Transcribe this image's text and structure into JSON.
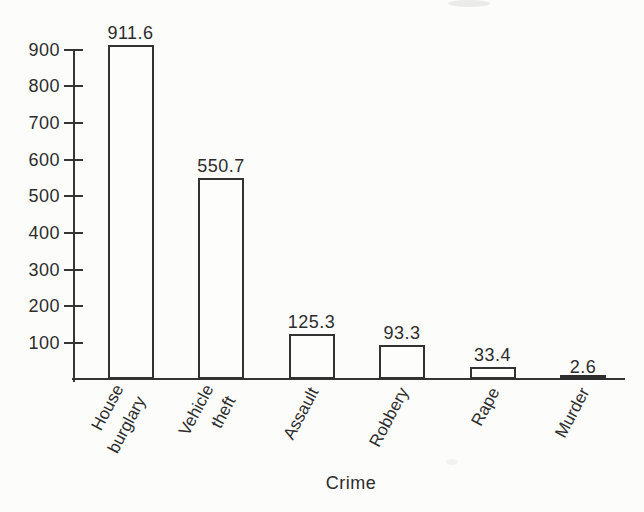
{
  "figure": {
    "background": "#fcfcfb",
    "ink_color": "#323232"
  },
  "chart_data": {
    "type": "bar",
    "title": "",
    "xlabel": "Crime",
    "ylabel": "",
    "ylim": [
      0,
      950
    ],
    "yticks": [
      900,
      800,
      700,
      600,
      500,
      400,
      300,
      200,
      100
    ],
    "grid": false,
    "legend_position": "none",
    "bar_fill": "#fdfdfc",
    "bar_border": "#323232",
    "categories": [
      {
        "label": "House burglary",
        "lines": [
          "House",
          "burglary"
        ],
        "value": 911.6,
        "value_label": "911.6"
      },
      {
        "label": "Vehicle theft",
        "lines": [
          "Vehicle",
          "theft"
        ],
        "value": 550.7,
        "value_label": "550.7"
      },
      {
        "label": "Assault",
        "lines": [
          "Assault"
        ],
        "value": 125.3,
        "value_label": "125.3"
      },
      {
        "label": "Robbery",
        "lines": [
          "Robbery"
        ],
        "value": 93.3,
        "value_label": "93.3"
      },
      {
        "label": "Rape",
        "lines": [
          "Rape"
        ],
        "value": 33.4,
        "value_label": "33.4"
      },
      {
        "label": "Murder",
        "lines": [
          "Murder"
        ],
        "value": 2.6,
        "value_label": "2.6"
      }
    ]
  }
}
